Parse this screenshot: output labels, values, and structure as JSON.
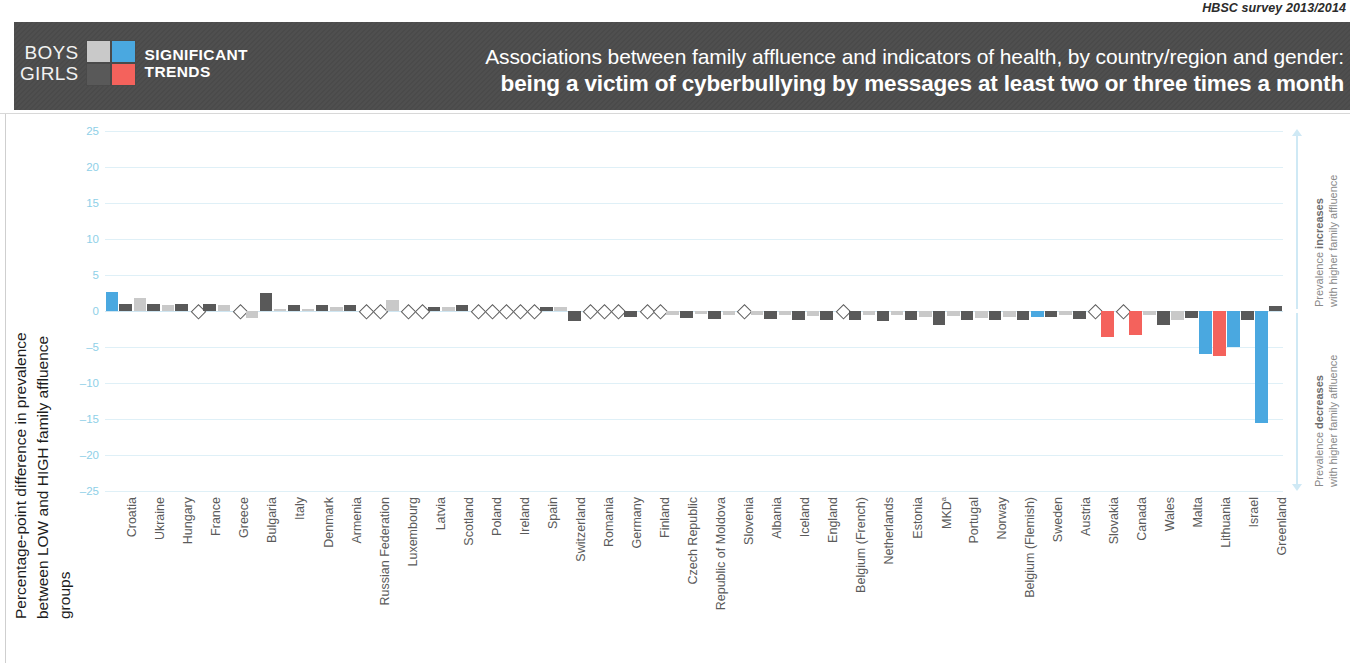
{
  "source_note": "HBSC survey 2013/2014",
  "header": {
    "legend_boys_label": "BOYS",
    "legend_girls_label": "GIRLS",
    "legend_caption_line1": "SIGNIFICANT",
    "legend_caption_line2": "TRENDS",
    "title_line1": "Associations between family affluence and indicators of health, by country/region and gender:",
    "title_line2": "being a victim of cyberbullying by messages at least two or three times a month"
  },
  "colors": {
    "boys_significant": "#4aa8e0",
    "girls_significant": "#f4625c",
    "boys_nonsignificant": "#c9c9c9",
    "girls_nonsignificant": "#595959",
    "header_band": "#4a4a4a",
    "gridline": "#dff0f7",
    "tick_text": "#8fd0e8"
  },
  "axis": {
    "y_title_line1": "Percentage-point difference in prevalence",
    "y_title_line2": "between LOW and HIGH family affluence groups",
    "y_ticks": [
      "25",
      "20",
      "15",
      "10",
      "5",
      "0",
      "–5",
      "–10",
      "–15",
      "–20",
      "–25"
    ]
  },
  "annotations": {
    "increase_bold": "increases",
    "increase_prefix": "Prevalence ",
    "increase_line2": "with higher family affluence",
    "decrease_bold": "decreases",
    "decrease_prefix": "Prevalence ",
    "decrease_line2": "with higher family affluence"
  },
  "chart_data": {
    "type": "bar",
    "title": "being a victim of cyberbullying by messages at least two or three times a month",
    "subtitle": "Associations between family affluence and indicators of health, by country/region and gender",
    "xlabel": "",
    "ylabel": "Percentage-point difference in prevalence between LOW and HIGH family affluence groups",
    "ylim": [
      -25,
      25
    ],
    "ytick_step": 5,
    "grid": true,
    "legend_position": "header",
    "series": [
      {
        "name": "Boys",
        "color_significant": "#4aa8e0",
        "color_nonsignificant": "#c9c9c9"
      },
      {
        "name": "Girls",
        "color_significant": "#f4625c",
        "color_nonsignificant": "#595959"
      }
    ],
    "categories": [
      "Croatia",
      "Ukraine",
      "Hungary",
      "France",
      "Greece",
      "Bulgaria",
      "Italy",
      "Denmark",
      "Armenia",
      "Russian Federation",
      "Luxembourg",
      "Latvia",
      "Scotland",
      "Poland",
      "Ireland",
      "Spain",
      "Switzerland",
      "Romania",
      "Germany",
      "Finland",
      "Czech Republic",
      "Republic of Moldova",
      "Slovenia",
      "Albania",
      "Iceland",
      "England",
      "Belgium (French)",
      "Netherlands",
      "Estonia",
      "MKD",
      "Portugal",
      "Norway",
      "Belgium (Flemish)",
      "Sweden",
      "Austria",
      "Slovakia",
      "Canada",
      "Wales",
      "Malta",
      "Lithuania",
      "Israel",
      "Greenland"
    ],
    "boys": [
      2.6,
      1.8,
      0.8,
      0.0,
      0.8,
      -1.0,
      0.3,
      0.3,
      0.5,
      0.0,
      1.5,
      0.0,
      0.5,
      0.0,
      0.0,
      0.0,
      0.6,
      0.0,
      0.0,
      0.0,
      -0.6,
      -0.4,
      -0.5,
      -0.5,
      -0.5,
      -0.7,
      0.0,
      -0.5,
      -0.5,
      -0.8,
      -0.7,
      -1.0,
      -0.9,
      -0.8,
      -0.6,
      0.0,
      0.0,
      -0.6,
      -1.2,
      -6.0,
      -5.0,
      -15.5
    ],
    "girls": [
      1.0,
      1.0,
      1.0,
      1.0,
      0.0,
      2.5,
      0.8,
      0.8,
      0.8,
      0.0,
      0.0,
      0.6,
      0.9,
      0.0,
      0.0,
      0.5,
      -1.4,
      0.0,
      -0.9,
      0.0,
      -1.0,
      -1.1,
      0.0,
      -1.1,
      -1.3,
      -1.3,
      -1.2,
      -1.4,
      -1.2,
      -2.0,
      -1.2,
      -1.2,
      -1.3,
      -0.9,
      -1.1,
      -3.6,
      -3.4,
      -2.0,
      -1.0,
      -6.2,
      -1.3,
      0.7
    ],
    "boys_significant": [
      true,
      false,
      false,
      false,
      false,
      false,
      false,
      false,
      false,
      false,
      false,
      false,
      false,
      false,
      false,
      false,
      false,
      false,
      false,
      false,
      false,
      false,
      false,
      false,
      false,
      false,
      false,
      false,
      false,
      false,
      false,
      false,
      false,
      true,
      false,
      false,
      false,
      false,
      false,
      true,
      true,
      true
    ],
    "girls_significant": [
      false,
      false,
      false,
      false,
      false,
      false,
      false,
      false,
      false,
      false,
      false,
      false,
      false,
      false,
      false,
      false,
      false,
      false,
      false,
      false,
      false,
      false,
      false,
      false,
      false,
      false,
      false,
      false,
      false,
      false,
      false,
      false,
      false,
      false,
      false,
      true,
      true,
      false,
      false,
      true,
      false,
      false
    ],
    "boys_zero_marker": [
      false,
      false,
      false,
      true,
      false,
      false,
      false,
      false,
      false,
      true,
      false,
      true,
      false,
      true,
      true,
      true,
      false,
      true,
      true,
      true,
      false,
      false,
      false,
      false,
      false,
      false,
      true,
      false,
      false,
      false,
      false,
      false,
      false,
      false,
      false,
      true,
      true,
      false,
      false,
      false,
      false,
      false
    ],
    "girls_zero_marker": [
      false,
      false,
      false,
      false,
      true,
      false,
      false,
      false,
      false,
      true,
      true,
      false,
      false,
      true,
      true,
      false,
      false,
      true,
      false,
      true,
      false,
      false,
      true,
      false,
      false,
      false,
      false,
      false,
      false,
      false,
      false,
      false,
      false,
      false,
      false,
      false,
      false,
      false,
      false,
      false,
      false,
      false
    ]
  }
}
